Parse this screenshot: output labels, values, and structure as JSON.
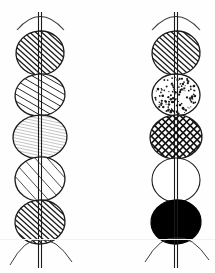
{
  "figure": {
    "width": 215,
    "height": 273,
    "background_color": "#fefefe",
    "ink_color": "#1a1a1a",
    "medium_ink_color": "#3a3a3a",
    "light_ink_color": "#8a8a8a",
    "scan_line_color": "#f2f2f2",
    "scan_line_y": 239
  },
  "columns": [
    {
      "name": "left-stem",
      "axis_x": 40,
      "stem_gap": 3,
      "stem_top_y": 12,
      "stem_bottom_y": 268,
      "top_arc": {
        "name": "top-arc",
        "left_x": 17,
        "right_x": 64,
        "y": 30,
        "peak_y": 11
      },
      "root_arcs": [
        {
          "name": "root-arc-left",
          "from_x": 10,
          "to_x": 40,
          "y_start": 265,
          "y_end": 240
        },
        {
          "name": "root-arc-right",
          "from_x": 40,
          "to_x": 72,
          "y_start": 240,
          "y_end": 262
        }
      ],
      "discs": [
        {
          "name": "disc-1",
          "cy": 53,
          "rx": 24,
          "ry": 22,
          "fill": "hatch-dense-right",
          "rotation": -4
        },
        {
          "name": "disc-2",
          "cy": 95,
          "rx": 25,
          "ry": 21,
          "fill": "hatch-medium-right",
          "rotation": -6
        },
        {
          "name": "disc-3",
          "cy": 137,
          "rx": 27,
          "ry": 22,
          "fill": "hatch-fine-light",
          "rotation": -3
        },
        {
          "name": "disc-4",
          "cy": 179,
          "rx": 25,
          "ry": 22,
          "fill": "hatch-sparse-right",
          "rotation": -5
        },
        {
          "name": "disc-5",
          "cy": 222,
          "rx": 25,
          "ry": 22,
          "fill": "hatch-dense-right",
          "rotation": -4
        }
      ]
    },
    {
      "name": "right-stem",
      "axis_x": 176,
      "stem_gap": 3,
      "stem_top_y": 12,
      "stem_bottom_y": 268,
      "top_arc": {
        "name": "top-arc",
        "left_x": 152,
        "right_x": 200,
        "y": 30,
        "peak_y": 11
      },
      "root_arcs": [
        {
          "name": "root-arc-left",
          "from_x": 145,
          "to_x": 176,
          "y_start": 262,
          "y_end": 238
        },
        {
          "name": "root-arc-right",
          "from_x": 176,
          "to_x": 209,
          "y_start": 238,
          "y_end": 260
        }
      ],
      "discs": [
        {
          "name": "disc-1",
          "cy": 53,
          "rx": 24,
          "ry": 22,
          "fill": "hatch-dense-right",
          "rotation": -4
        },
        {
          "name": "disc-2",
          "cy": 95,
          "rx": 24,
          "ry": 21,
          "fill": "stipple-dots",
          "rotation": 0
        },
        {
          "name": "disc-3",
          "cy": 137,
          "rx": 26,
          "ry": 22,
          "fill": "cross-hatch",
          "rotation": -4
        },
        {
          "name": "disc-4",
          "cy": 180,
          "rx": 24,
          "ry": 22,
          "fill": "blank-white",
          "rotation": 0
        },
        {
          "name": "disc-5",
          "cy": 222,
          "rx": 25,
          "ry": 22,
          "fill": "solid-black",
          "rotation": -4
        }
      ]
    }
  ],
  "legend": {
    "fill_patterns": [
      {
        "key": "hatch-dense-right",
        "label": "dense right-leaning hatching",
        "spacing": 4,
        "angle": 42,
        "stroke": "#1a1a1a",
        "stroke_width": 1.3
      },
      {
        "key": "hatch-medium-right",
        "label": "medium right-leaning hatching",
        "spacing": 6,
        "angle": 30,
        "stroke": "#2a2a2a",
        "stroke_width": 1.0
      },
      {
        "key": "hatch-fine-light",
        "label": "fine light near-horizontal hatching",
        "spacing": 3,
        "angle": 12,
        "stroke": "#9a9a9a",
        "stroke_width": 0.6
      },
      {
        "key": "hatch-sparse-right",
        "label": "sparse right-leaning hatching",
        "spacing": 9,
        "angle": 48,
        "stroke": "#3a3a3a",
        "stroke_width": 0.9
      },
      {
        "key": "stipple-dots",
        "label": "stippled dots",
        "dot_count": 120,
        "dot_radius": 0.9,
        "fill": "#1a1a1a"
      },
      {
        "key": "cross-hatch",
        "label": "cross hatching diamond grid",
        "spacing": 5,
        "angle": 45,
        "stroke": "#111111",
        "stroke_width": 1.6
      },
      {
        "key": "blank-white",
        "label": "unfilled white",
        "fill": "#ffffff"
      },
      {
        "key": "solid-black",
        "label": "solid black fill",
        "fill": "#000000"
      }
    ]
  }
}
